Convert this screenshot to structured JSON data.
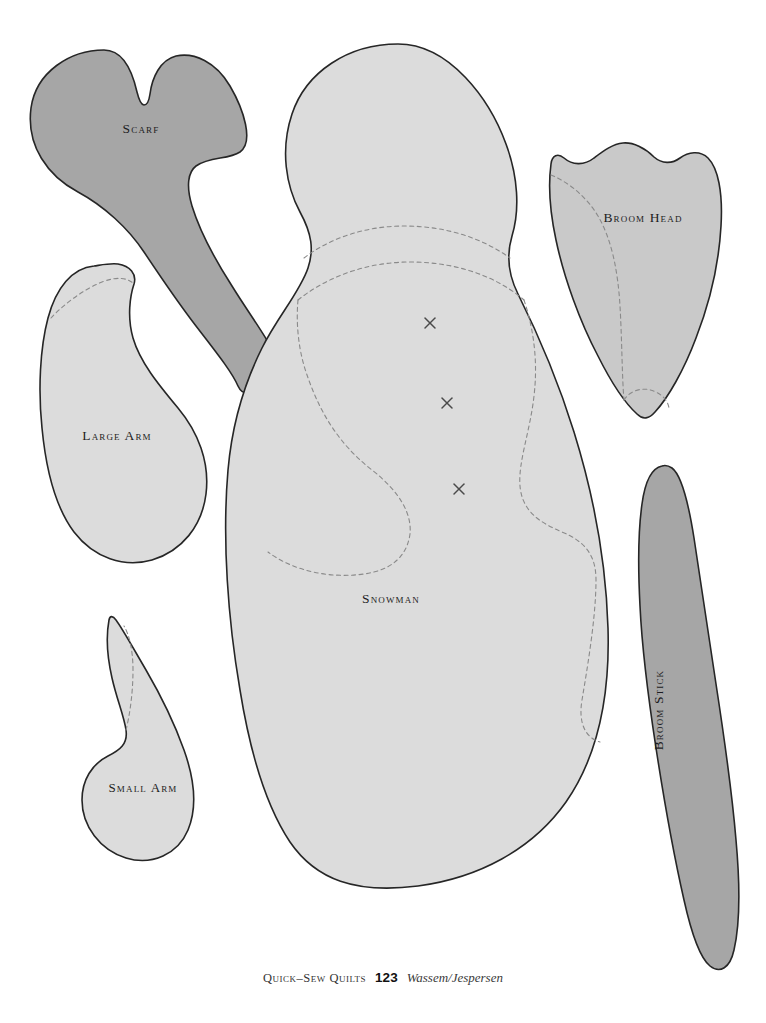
{
  "document": {
    "type": "sewing-pattern-template-sheet",
    "background_color": "#ffffff"
  },
  "colors": {
    "fabric_light": "#dcdcdc",
    "fabric_medium": "#c9c9c9",
    "fabric_dark": "#a6a6a6",
    "outline": "#262626",
    "seam_dash": "#8a8a8a",
    "label_text": "#1c1c22"
  },
  "pieces": [
    {
      "id": "scarf",
      "label": "Scarf",
      "fill": "#a6a6a6",
      "label_x": 141,
      "label_y": 133
    },
    {
      "id": "large-arm",
      "label": "Large Arm",
      "fill": "#dcdcdc",
      "label_x": 117,
      "label_y": 440
    },
    {
      "id": "small-arm",
      "label": "Small Arm",
      "fill": "#dcdcdc",
      "label_x": 143,
      "label_y": 792
    },
    {
      "id": "snowman",
      "label": "Snowman",
      "fill": "#dcdcdc",
      "label_x": 391,
      "label_y": 603
    },
    {
      "id": "broom-head",
      "label": "Broom Head",
      "fill": "#c9c9c9",
      "label_x": 643,
      "label_y": 222
    },
    {
      "id": "broom-stick",
      "label": "Broom Stick",
      "fill": "#a6a6a6",
      "label_x": 663,
      "label_y": 710,
      "rotation": -90
    }
  ],
  "snowman_marks": {
    "description": "button placement crosses",
    "points": [
      {
        "x": 430,
        "y": 323
      },
      {
        "x": 447,
        "y": 403
      },
      {
        "x": 459,
        "y": 489
      }
    ],
    "size": 9
  },
  "footer": {
    "title": "Quick–Sew Quilts",
    "page_number": "123",
    "credit": "Wassem/Jespersen"
  }
}
